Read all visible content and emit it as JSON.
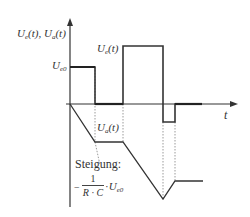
{
  "diagram": {
    "axes": {
      "y_label": "U_e(t), U_a(t)",
      "y_label_main": "U",
      "y_label_parts": [
        "U",
        "e",
        "(t), ",
        "U",
        "a",
        "(t)"
      ],
      "x_label": "t"
    },
    "levels": {
      "ue0_label_main": "U",
      "ue0_label_sub": "e0"
    },
    "curves": {
      "ue_label_main": "U",
      "ue_label_sub": "e",
      "ue_label_rest": "(t)",
      "ua_label_main": "U",
      "ua_label_sub": "a",
      "ua_label_rest": "(t)"
    },
    "annotation": {
      "title": "Steigung:",
      "minus": "−",
      "numerator": "1",
      "denominator": "R · C",
      "dot": "·",
      "factor_main": "U",
      "factor_sub": "e0"
    },
    "colors": {
      "line": "#333333",
      "dotted": "#999999",
      "background": "#ffffff"
    }
  }
}
